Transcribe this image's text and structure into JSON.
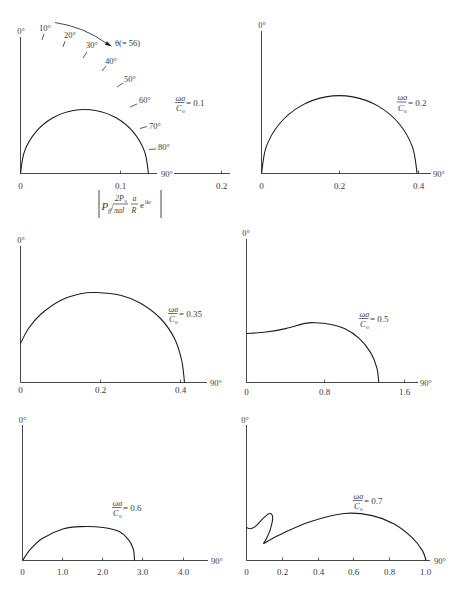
{
  "panel_1_annotations": {
    "angle_labels": [
      "10°",
      "20°",
      "30°",
      "40°",
      "50°",
      "60°",
      "70°",
      "80°"
    ],
    "theta_arrow_label": "θ(= 56)",
    "magnitude_formula": {
      "P": "P",
      "P_sub": "ff",
      "slash": "/",
      "num_2P": "2P",
      "num_sub": "0",
      "den": "πal",
      "a": "a",
      "R": "R",
      "e": "e",
      "e_sup": "ikr"
    }
  },
  "chart_data": [
    {
      "type": "line",
      "plot_kind": "polar directivity (0° vertical, 90° horizontal)",
      "title": "ωa/Co = 0.1",
      "label": {
        "num": "ωa",
        "den": "C",
        "den_sub": "o",
        "value": "= 0.1"
      },
      "param": 0.1,
      "xlabel": "|P_ff / (2P_0/πal) · (a/R) e^{ikr}|",
      "y_axis_top_label": "0°",
      "x_axis_end_label": "90°",
      "x_ticks": [
        "0",
        "0.1",
        "0.2"
      ],
      "xlim": [
        0,
        0.2
      ],
      "grid": false,
      "segments": [
        [
          [
            0,
            0
          ],
          [
            0.0039,
            0.0219
          ],
          [
            0.015,
            0.0411
          ],
          [
            0.032,
            0.0554
          ],
          [
            0.0529,
            0.063
          ],
          [
            0.0751,
            0.063
          ],
          [
            0.096,
            0.0554
          ],
          [
            0.113,
            0.0411
          ],
          [
            0.1241,
            0.0219
          ],
          [
            0.128,
            0
          ]
        ]
      ]
    },
    {
      "type": "line",
      "plot_kind": "polar directivity (0° vertical, 90° horizontal)",
      "title": "ωa/Co = 0.2",
      "label": {
        "num": "ωa",
        "den": "C",
        "den_sub": "o",
        "value": "= 0.2"
      },
      "param": 0.2,
      "y_axis_top_label": "0°",
      "x_axis_end_label": "90°",
      "x_ticks": [
        "0",
        "0.2",
        "0.4"
      ],
      "xlim": [
        0,
        0.4
      ],
      "grid": false,
      "segments": [
        [
          [
            0,
            0
          ],
          [
            0.012,
            0.0679
          ],
          [
            0.0464,
            0.1276
          ],
          [
            0.0993,
            0.1719
          ],
          [
            0.164,
            0.1955
          ],
          [
            0.233,
            0.1955
          ],
          [
            0.2978,
            0.1719
          ],
          [
            0.3506,
            0.1276
          ],
          [
            0.385,
            0.0679
          ],
          [
            0.397,
            0
          ]
        ]
      ]
    },
    {
      "type": "line",
      "plot_kind": "polar directivity (0° vertical, 90° horizontal)",
      "title": "ωa/Co = 0.35",
      "label": {
        "num": "ωa",
        "den": "C",
        "den_sub": "o",
        "value": "= 0.35"
      },
      "param": 0.35,
      "y_axis_top_label": "0°",
      "x_axis_end_label": "90°",
      "x_ticks": [
        "0",
        "0.2",
        "0.4"
      ],
      "xlim": [
        0,
        0.45
      ],
      "grid": false,
      "segments": [
        [
          [
            0,
            0.0975
          ],
          [
            0.02,
            0.135
          ],
          [
            0.05,
            0.17
          ],
          [
            0.1,
            0.205
          ],
          [
            0.15,
            0.222
          ],
          [
            0.19,
            0.225
          ],
          [
            0.25,
            0.218
          ],
          [
            0.3,
            0.198
          ],
          [
            0.35,
            0.16
          ],
          [
            0.385,
            0.11
          ],
          [
            0.403,
            0.055
          ],
          [
            0.41,
            0
          ]
        ]
      ]
    },
    {
      "type": "line",
      "plot_kind": "polar directivity (0° vertical, 90° horizontal)",
      "title": "ωa/Co = 0.5",
      "label": {
        "num": "ωa",
        "den": "C",
        "den_sub": "o",
        "value": "= 0.5"
      },
      "param": 0.5,
      "y_axis_top_label": "0°",
      "x_axis_end_label": "90°",
      "x_ticks": [
        "0",
        "0.8",
        "1.6"
      ],
      "xlim": [
        0,
        1.75
      ],
      "grid": false,
      "segments": [
        [
          [
            0,
            0.5
          ],
          [
            0.2,
            0.515
          ],
          [
            0.4,
            0.55
          ],
          [
            0.6,
            0.603
          ],
          [
            0.7,
            0.61
          ],
          [
            0.85,
            0.595
          ],
          [
            1.0,
            0.55
          ],
          [
            1.15,
            0.45
          ],
          [
            1.27,
            0.3
          ],
          [
            1.33,
            0.15
          ],
          [
            1.35,
            0
          ]
        ]
      ]
    },
    {
      "type": "line",
      "plot_kind": "polar directivity (0° vertical, 90° horizontal)",
      "title": "ωa/Co = 0.6",
      "label": {
        "num": "ωa",
        "den": "C",
        "den_sub": "o",
        "value": "= 0.6"
      },
      "param": 0.6,
      "y_axis_top_label": "0°",
      "x_axis_end_label": "90°",
      "x_ticks": [
        "0",
        "1.0",
        "2.0",
        "3.0",
        "4.0"
      ],
      "xlim": [
        0,
        4.6
      ],
      "grid": false,
      "segments": [
        [
          [
            0,
            0
          ],
          [
            0.2,
            0.28
          ],
          [
            0.5,
            0.55
          ],
          [
            1.0,
            0.78
          ],
          [
            1.44,
            0.84
          ],
          [
            2.0,
            0.82
          ],
          [
            2.4,
            0.72
          ],
          [
            2.63,
            0.52
          ],
          [
            2.75,
            0.28
          ],
          [
            2.78,
            0
          ]
        ]
      ]
    },
    {
      "type": "line",
      "plot_kind": "polar directivity (0° vertical, 90° horizontal)",
      "title": "ωa/Co = 0.7",
      "label": {
        "num": "ωa",
        "den": "C",
        "den_sub": "o",
        "value": "= 0.7"
      },
      "param": 0.7,
      "y_axis_top_label": "0°",
      "x_axis_end_label": "90°",
      "x_ticks": [
        "0",
        "0.2",
        "0.4",
        "0.6",
        "0.8",
        "1.0"
      ],
      "xlim": [
        0,
        1.03
      ],
      "grid": false,
      "segments": [
        [
          [
            0,
            0.184
          ],
          [
            0.02,
            0.177
          ],
          [
            0.05,
            0.19
          ],
          [
            0.09,
            0.232
          ],
          [
            0.125,
            0.26
          ],
          [
            0.142,
            0.255
          ],
          [
            0.145,
            0.225
          ],
          [
            0.13,
            0.165
          ],
          [
            0.11,
            0.12
          ],
          [
            0.095,
            0.095
          ]
        ],
        [
          [
            0.095,
            0.095
          ],
          [
            0.2,
            0.15
          ],
          [
            0.35,
            0.215
          ],
          [
            0.546,
            0.262
          ],
          [
            0.7,
            0.25
          ],
          [
            0.82,
            0.205
          ],
          [
            0.92,
            0.13
          ],
          [
            0.98,
            0.055
          ],
          [
            1.0,
            0
          ]
        ]
      ]
    }
  ]
}
